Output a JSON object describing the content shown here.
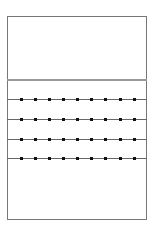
{
  "diagram": {
    "frame": {
      "left": 7,
      "top": 16,
      "width": 140,
      "height": 204,
      "border_color": "#777777"
    },
    "divider": {
      "y": 79,
      "color": "#999999"
    },
    "rows": [
      {
        "y": 99
      },
      {
        "y": 119
      },
      {
        "y": 139
      },
      {
        "y": 158
      }
    ],
    "dot_x": [
      21,
      35,
      49,
      63,
      77,
      91,
      105,
      120,
      134
    ],
    "dot_color": "#111111",
    "line_color": "#666666"
  }
}
